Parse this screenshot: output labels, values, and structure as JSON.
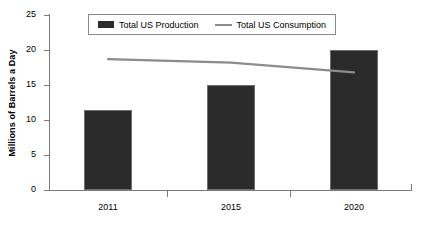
{
  "chart_data": {
    "type": "bar",
    "title": "",
    "xlabel": "",
    "ylabel": "Millions of Barrels a Day",
    "categories": [
      "2011",
      "2015",
      "2020"
    ],
    "ylim": [
      0,
      25
    ],
    "yticks": [
      0,
      5,
      10,
      15,
      20,
      25
    ],
    "ytick_labels": [
      "0",
      "5",
      "10",
      "15",
      "20",
      "25"
    ],
    "grid": false,
    "legend_position": "top-center",
    "series": [
      {
        "name": "Total US Production",
        "type": "bar",
        "color": "#2b2b2b",
        "values": [
          11.3,
          14.9,
          19.9
        ]
      },
      {
        "name": "Total US Consumption",
        "type": "line",
        "color": "#8c8c8c",
        "values": [
          18.6,
          18.1,
          16.7
        ]
      }
    ]
  },
  "legend": {
    "items": [
      {
        "label": "Total US Production",
        "marker": "bar-swatch-icon"
      },
      {
        "label": "Total US Consumption",
        "marker": "line-swatch-icon"
      }
    ]
  }
}
